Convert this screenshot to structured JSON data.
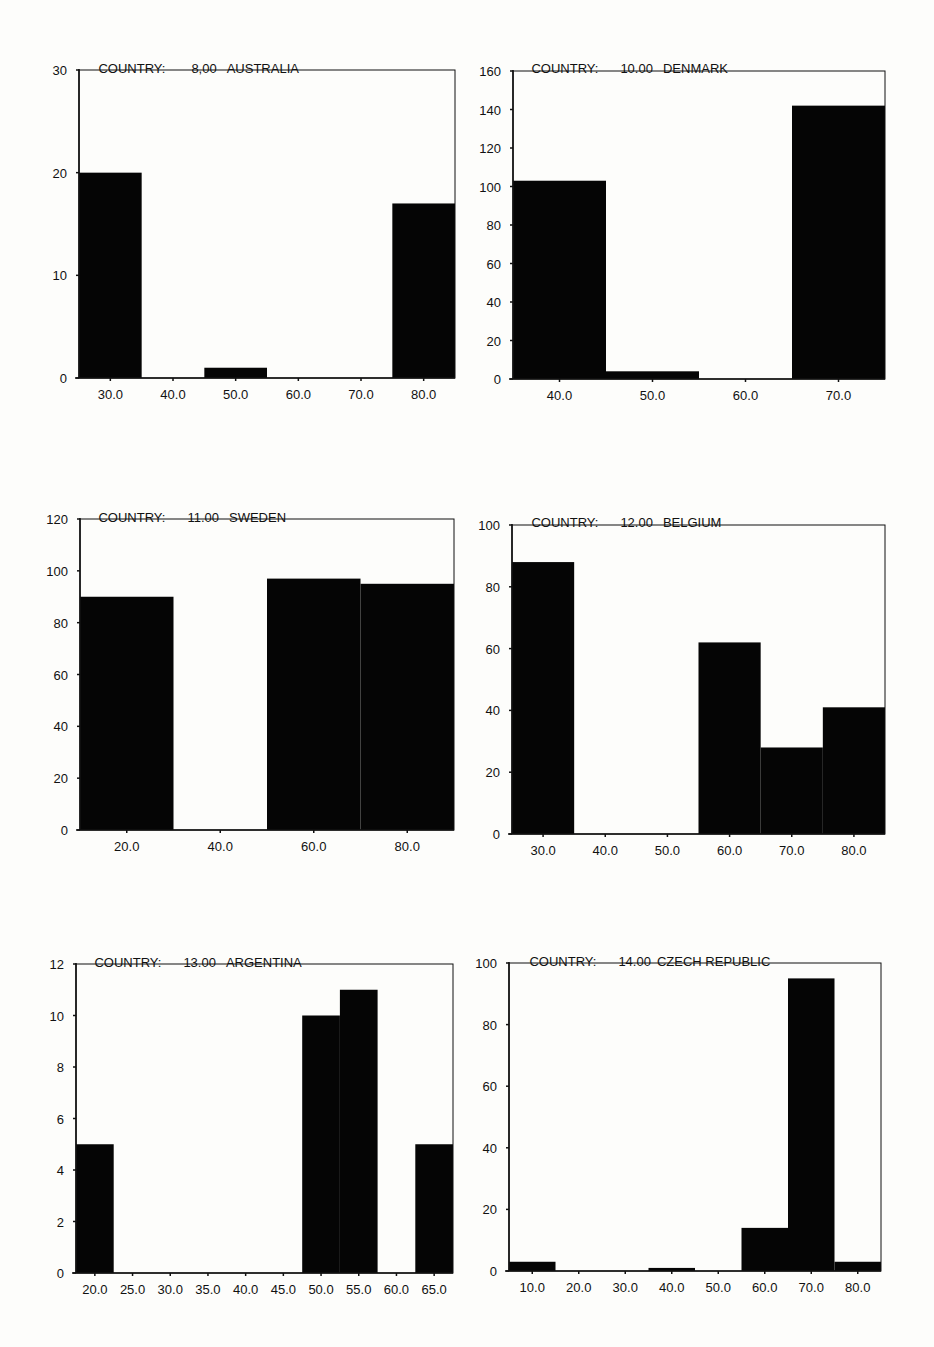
{
  "chart_data": [
    {
      "type": "bar",
      "title": "COUNTRY:    8,00  AUSTRALIA",
      "title_prefix": "COUNTRY:",
      "country_code": "8,00",
      "country": "AUSTRALIA",
      "xlabel": "",
      "ylabel": "",
      "ylim": [
        0,
        30
      ],
      "yticks": [
        0,
        10,
        20,
        30
      ],
      "xlim": [
        25,
        85
      ],
      "bin_width": 10,
      "categories": [
        "30.0",
        "40.0",
        "50.0",
        "60.0",
        "70.0",
        "80.0"
      ],
      "x": [
        30,
        40,
        50,
        60,
        70,
        80
      ],
      "values": [
        20,
        0,
        1,
        0,
        0,
        17
      ],
      "grid": false,
      "legend": null
    },
    {
      "type": "bar",
      "title": "COUNTRY:    10.00  DENMARK",
      "title_prefix": "COUNTRY:",
      "country_code": "10.00",
      "country": "DENMARK",
      "xlabel": "",
      "ylabel": "",
      "ylim": [
        0,
        160
      ],
      "yticks": [
        0,
        20,
        40,
        60,
        80,
        100,
        120,
        140,
        160
      ],
      "xlim": [
        35,
        75
      ],
      "bin_width": 10,
      "categories": [
        "40.0",
        "50.0",
        "60.0",
        "70.0"
      ],
      "x": [
        40,
        50,
        60,
        70
      ],
      "values": [
        103,
        4,
        0,
        142
      ],
      "grid": false,
      "legend": null
    },
    {
      "type": "bar",
      "title": "COUNTRY:    11.00  SWEDEN",
      "title_prefix": "COUNTRY:",
      "country_code": "11.00",
      "country": "SWEDEN",
      "xlabel": "",
      "ylabel": "",
      "ylim": [
        0,
        120
      ],
      "yticks": [
        0,
        20,
        40,
        60,
        80,
        100,
        120
      ],
      "xlim": [
        10,
        90
      ],
      "bin_width": 20,
      "categories": [
        "20.0",
        "40.0",
        "60.0",
        "80.0"
      ],
      "x": [
        20,
        40,
        60,
        80
      ],
      "values": [
        90,
        0,
        97,
        95
      ],
      "grid": false,
      "legend": null
    },
    {
      "type": "bar",
      "title": "COUNTRY:    12.00  BELGIUM",
      "title_prefix": "COUNTRY:",
      "country_code": "12.00",
      "country": "BELGIUM",
      "xlabel": "",
      "ylabel": "",
      "ylim": [
        0,
        100
      ],
      "yticks": [
        0,
        20,
        40,
        60,
        80,
        100
      ],
      "xlim": [
        25,
        85
      ],
      "bin_width": 10,
      "categories": [
        "30.0",
        "40.0",
        "50.0",
        "60.0",
        "70.0",
        "80.0"
      ],
      "x": [
        30,
        40,
        50,
        60,
        70,
        80
      ],
      "values": [
        88,
        0,
        0,
        62,
        28,
        41
      ],
      "grid": false,
      "legend": null
    },
    {
      "type": "bar",
      "title": "COUNTRY:    13.00  ARGENTINA",
      "title_prefix": "COUNTRY:",
      "country_code": "13.00",
      "country": "ARGENTINA",
      "xlabel": "",
      "ylabel": "",
      "ylim": [
        0,
        12
      ],
      "yticks": [
        0,
        2,
        4,
        6,
        8,
        10,
        12
      ],
      "xlim": [
        17.5,
        67.5
      ],
      "bin_width": 5,
      "categories": [
        "20.0",
        "25.0",
        "30.0",
        "35.0",
        "40.0",
        "45.0",
        "50.0",
        "55.0",
        "60.0",
        "65.0"
      ],
      "x": [
        20,
        25,
        30,
        35,
        40,
        45,
        50,
        55,
        60,
        65
      ],
      "values": [
        5,
        0,
        0,
        0,
        0,
        0,
        10,
        11,
        0,
        5
      ],
      "grid": false,
      "legend": null
    },
    {
      "type": "bar",
      "title": "COUNTRY:    14.00  CZECH REPUBLIC",
      "title_prefix": "COUNTRY:",
      "country_code": "14.00",
      "country": "CZECH REPUBLIC",
      "xlabel": "",
      "ylabel": "",
      "ylim": [
        0,
        100
      ],
      "yticks": [
        0,
        20,
        40,
        60,
        80,
        100
      ],
      "xlim": [
        5,
        85
      ],
      "bin_width": 10,
      "categories": [
        "10.0",
        "20.0",
        "30.0",
        "40.0",
        "50.0",
        "60.0",
        "70.0",
        "80.0"
      ],
      "x": [
        10,
        20,
        30,
        40,
        50,
        60,
        70,
        80
      ],
      "values": [
        3,
        0,
        0,
        1,
        0,
        14,
        95,
        3
      ],
      "grid": false,
      "legend": null
    }
  ],
  "panels": [
    {
      "title_prefix": "COUNTRY:",
      "country_code": "8,00",
      "country": "AUSTRALIA"
    },
    {
      "title_prefix": "COUNTRY:",
      "country_code": "10.00",
      "country": "DENMARK"
    },
    {
      "title_prefix": "COUNTRY:",
      "country_code": "11.00",
      "country": "SWEDEN"
    },
    {
      "title_prefix": "COUNTRY:",
      "country_code": "12.00",
      "country": "BELGIUM"
    },
    {
      "title_prefix": "COUNTRY:",
      "country_code": "13.00",
      "country": "ARGENTINA"
    },
    {
      "title_prefix": "COUNTRY:",
      "country_code": "14.00",
      "country": "CZECH REPUBLIC"
    }
  ],
  "colors": {
    "bar": "#050505",
    "axis": "#111111",
    "background": "#fdfdfb"
  }
}
